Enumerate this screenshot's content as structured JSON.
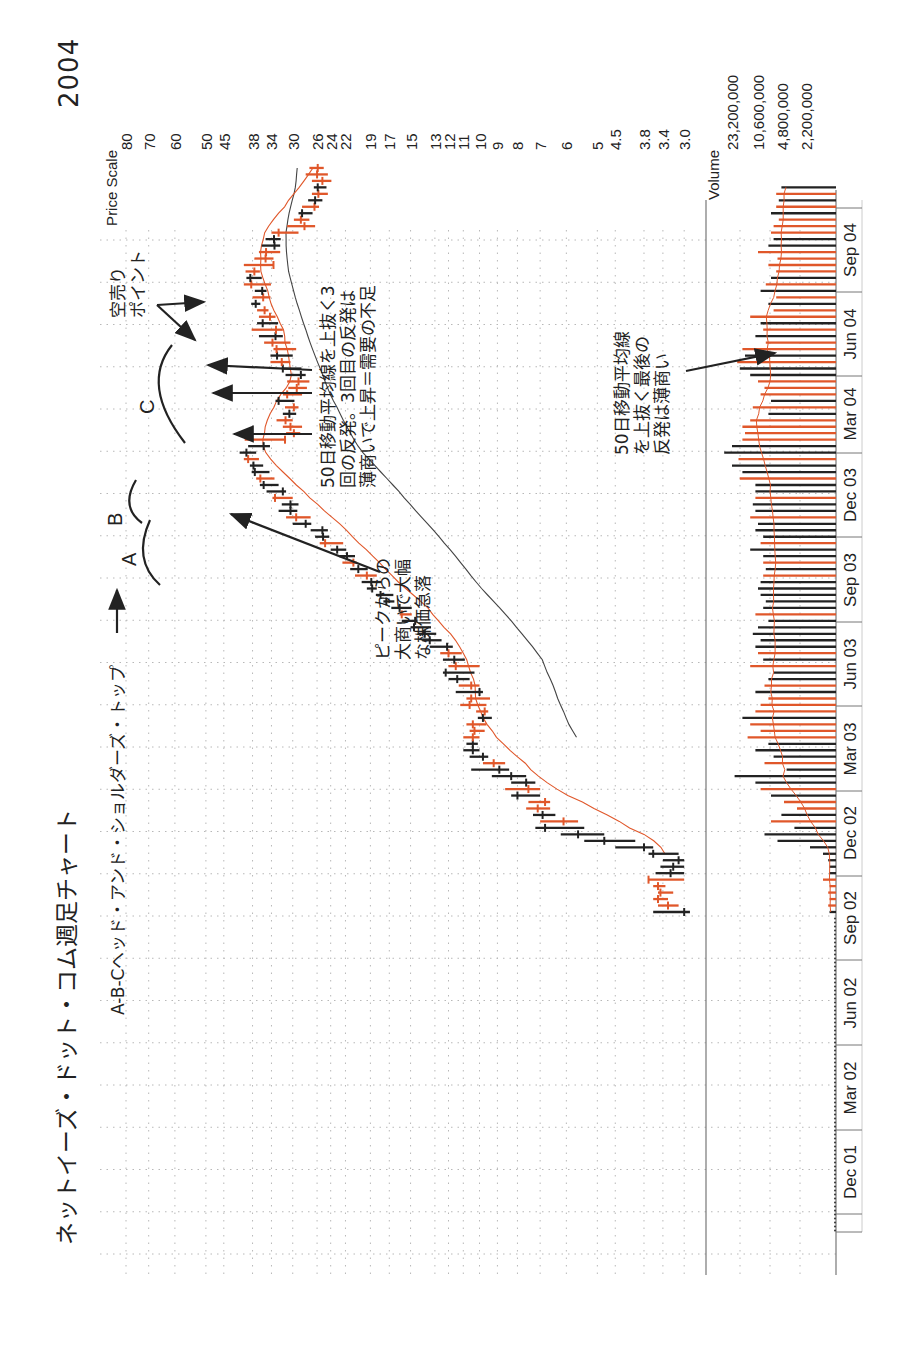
{
  "page": {
    "title": "ネットイーズ・ドット・コム週足チャート",
    "year": "2004",
    "subtitle": "A-B-Cヘッド・アンド・ショルダーズ・トップ"
  },
  "annotations": {
    "label_a": "A",
    "label_b": "B",
    "label_c": "C",
    "peak_drop": "ピークからの\n大商いで大幅\nな株価急落",
    "three_rallies": "50日移動平均線を上抜く3\n回の反発。3回目の反発は\n薄商いで上昇＝需要の不足",
    "short_point": "空売り\nポイント",
    "last_rally_volume": "50日移動平均線\nを上抜く最後の\n反発は薄商い"
  },
  "colors": {
    "up_bar": "#e0572a",
    "down_bar": "#222222",
    "ma50": "#e0572a",
    "ma200": "#444444",
    "grid": "#b8b8b8",
    "axis": "#777777"
  },
  "chart_data": {
    "type": "bar",
    "title": "ネットイーズ・ドット・コム週足チャート",
    "subtitle": "A-B-Cヘッド・アンド・ショルダーズ・トップ",
    "orientation": "rotated-90 (time runs bottom-to-top, price increases leftward)",
    "price_axis": {
      "label": "Price Scale",
      "scale": "log",
      "ticks": [
        "80",
        "70",
        "60",
        "50",
        "45",
        "38",
        "34",
        "30",
        "26",
        "24",
        "22",
        "19",
        "17",
        "15",
        "13",
        "12",
        "11",
        "10",
        "9",
        "8",
        "7",
        "6",
        "5",
        "4.5",
        "3.8",
        "3.4",
        "3.0"
      ],
      "ylim": [
        3.0,
        80
      ]
    },
    "volume_axis": {
      "label": "Volume",
      "ticks": [
        "23,200,000",
        "10,600,000",
        "4,800,000",
        "2,200,000"
      ]
    },
    "time_axis": {
      "ticks": [
        "Dec 01",
        "Mar 02",
        "Jun 02",
        "Sep 02",
        "Dec 02",
        "Mar 03",
        "Jun 03",
        "Sep 03",
        "Dec 03",
        "Mar 04",
        "Jun 04",
        "Sep 04"
      ]
    },
    "series": [
      {
        "name": "weekly price bars (high, low, close, up)",
        "weeks_start": "Sep 02",
        "bars": [
          [
            3.6,
            2.9,
            3.0,
            0
          ],
          [
            3.5,
            3.1,
            3.3,
            1
          ],
          [
            3.6,
            3.3,
            3.5,
            1
          ],
          [
            3.5,
            3.2,
            3.45,
            1
          ],
          [
            3.6,
            3.35,
            3.5,
            1
          ],
          [
            3.7,
            3.0,
            3.7,
            1
          ],
          [
            3.55,
            3.0,
            3.25,
            0
          ],
          [
            3.45,
            3.0,
            3.2,
            0
          ],
          [
            3.4,
            3.0,
            3.1,
            0
          ],
          [
            3.7,
            3.1,
            3.6,
            0
          ],
          [
            4.5,
            3.6,
            3.8,
            0
          ],
          [
            5.4,
            4.0,
            4.8,
            0
          ],
          [
            6.2,
            4.8,
            5.6,
            0
          ],
          [
            7.2,
            5.4,
            6.8,
            0
          ],
          [
            7.0,
            5.6,
            6.1,
            1
          ],
          [
            7.3,
            6.4,
            6.9,
            0
          ],
          [
            7.6,
            6.6,
            7.1,
            1
          ],
          [
            7.5,
            6.6,
            6.8,
            1
          ],
          [
            8.3,
            7.0,
            8.0,
            0
          ],
          [
            8.6,
            7.0,
            7.5,
            1
          ],
          [
            8.3,
            7.2,
            7.6,
            0
          ],
          [
            9.3,
            7.6,
            8.3,
            0
          ],
          [
            10.5,
            8.4,
            8.9,
            0
          ],
          [
            9.8,
            8.6,
            9.2,
            1
          ],
          [
            10.6,
            9.5,
            9.8,
            0
          ],
          [
            11.0,
            10.0,
            10.4,
            0
          ],
          [
            10.8,
            10.1,
            10.4,
            0
          ],
          [
            11.0,
            10.0,
            10.4,
            1
          ],
          [
            10.6,
            9.7,
            10.3,
            1
          ],
          [
            10.8,
            9.6,
            10.4,
            1
          ],
          [
            10.1,
            9.3,
            9.8,
            0
          ],
          [
            10.2,
            9.5,
            9.7,
            1
          ],
          [
            11.2,
            9.6,
            10.6,
            1
          ],
          [
            10.8,
            9.4,
            10.5,
            1
          ],
          [
            11.5,
            9.8,
            10.0,
            0
          ],
          [
            11.3,
            10.0,
            10.5,
            1
          ],
          [
            12.0,
            10.6,
            11.4,
            0
          ],
          [
            12.4,
            10.3,
            12.2,
            0
          ],
          [
            12.0,
            10.0,
            11.5,
            1
          ],
          [
            12.4,
            10.9,
            11.6,
            0
          ],
          [
            12.6,
            11.1,
            12.0,
            1
          ],
          [
            13.4,
            11.7,
            12.1,
            0
          ],
          [
            14.0,
            12.5,
            13.4,
            0
          ],
          [
            14.4,
            12.9,
            13.8,
            0
          ],
          [
            15.0,
            13.3,
            14.7,
            0
          ],
          [
            15.8,
            14.4,
            14.6,
            0
          ],
          [
            16.0,
            14.9,
            15.8,
            1
          ],
          [
            16.8,
            14.9,
            16.0,
            0
          ],
          [
            17.6,
            16.5,
            17.3,
            0
          ],
          [
            18.4,
            16.6,
            17.9,
            0
          ],
          [
            19.4,
            18.3,
            18.8,
            0
          ],
          [
            20.0,
            17.8,
            18.9,
            0
          ],
          [
            20.8,
            18.3,
            19.4,
            1
          ],
          [
            21.4,
            19.3,
            20.4,
            0
          ],
          [
            22.4,
            20.6,
            21.0,
            1
          ],
          [
            22.8,
            20.8,
            21.8,
            0
          ],
          [
            24.0,
            21.9,
            23.1,
            0
          ],
          [
            25.6,
            22.3,
            24.8,
            1
          ],
          [
            26.3,
            24.2,
            25.1,
            0
          ],
          [
            27.0,
            24.4,
            25.2,
            0
          ],
          [
            30.0,
            26.9,
            27.8,
            0
          ],
          [
            31.2,
            27.0,
            29.4,
            1
          ],
          [
            32.6,
            29.2,
            30.4,
            0
          ],
          [
            32.0,
            29.0,
            30.4,
            0
          ],
          [
            33.8,
            30.0,
            33.3,
            1
          ],
          [
            35.0,
            31.2,
            31.8,
            0
          ],
          [
            36.4,
            32.6,
            35.6,
            0
          ],
          [
            37.2,
            33.4,
            36.3,
            1
          ],
          [
            38.2,
            34.4,
            37.5,
            0
          ],
          [
            38.6,
            35.7,
            37.8,
            0
          ],
          [
            40.0,
            36.6,
            39.0,
            1
          ],
          [
            41.0,
            37.2,
            39.4,
            0
          ],
          [
            39.0,
            34.3,
            35.6,
            0
          ],
          [
            39.8,
            31.2,
            31.4,
            1
          ],
          [
            31.2,
            28.7,
            29.8,
            1
          ],
          [
            31.8,
            28.4,
            30.4,
            1
          ],
          [
            33.0,
            30.0,
            31.3,
            1
          ],
          [
            31.8,
            29.4,
            30.6,
            0
          ],
          [
            31.4,
            29.0,
            29.8,
            1
          ],
          [
            33.2,
            29.7,
            32.6,
            0
          ],
          [
            31.8,
            28.4,
            31.0,
            1
          ],
          [
            30.8,
            27.6,
            29.3,
            1
          ],
          [
            31.0,
            27.2,
            29.0,
            1
          ],
          [
            31.3,
            27.8,
            28.6,
            0
          ],
          [
            32.0,
            28.5,
            31.8,
            0
          ],
          [
            34.2,
            30.4,
            32.0,
            1
          ],
          [
            34.2,
            30.0,
            32.9,
            0
          ],
          [
            33.6,
            29.4,
            33.0,
            1
          ],
          [
            35.5,
            30.4,
            33.8,
            1
          ],
          [
            36.6,
            31.8,
            33.2,
            0
          ],
          [
            38.2,
            31.8,
            33.1,
            1
          ],
          [
            37.0,
            32.7,
            35.8,
            0
          ],
          [
            36.6,
            33.2,
            34.3,
            1
          ],
          [
            37.0,
            34.6,
            35.4,
            1
          ],
          [
            38.3,
            36.3,
            37.3,
            0
          ],
          [
            38.0,
            34.2,
            35.7,
            1
          ],
          [
            37.5,
            35.0,
            35.9,
            0
          ],
          [
            40.0,
            34.1,
            38.3,
            1
          ],
          [
            39.4,
            36.0,
            38.5,
            0
          ],
          [
            39.6,
            36.4,
            37.6,
            1
          ],
          [
            40.0,
            33.6,
            33.6,
            1
          ],
          [
            37.6,
            33.6,
            35.2,
            1
          ],
          [
            36.6,
            32.3,
            35.1,
            1
          ],
          [
            36.0,
            32.3,
            33.4,
            0
          ],
          [
            35.2,
            32.2,
            33.5,
            0
          ],
          [
            34.0,
            29.0,
            32.6,
            1
          ],
          [
            31.0,
            26.3,
            28.0,
            1
          ],
          [
            29.8,
            27.2,
            28.6,
            1
          ],
          [
            29.0,
            26.7,
            28.4,
            0
          ],
          [
            28.4,
            25.7,
            26.4,
            1
          ],
          [
            27.4,
            25.2,
            26.3,
            0
          ],
          [
            26.8,
            24.4,
            25.8,
            1
          ],
          [
            26.5,
            24.6,
            25.9,
            0
          ],
          [
            26.8,
            23.9,
            25.2,
            1
          ],
          [
            27.8,
            24.4,
            26.0,
            1
          ],
          [
            27.2,
            25.0,
            25.9,
            1
          ]
        ]
      },
      {
        "name": "50-day moving average"
      },
      {
        "name": "200-day moving average"
      },
      {
        "name": "weekly volume (fraction of panel width)",
        "values": [
          0.05,
          0.06,
          0.05,
          0.06,
          0.05,
          0.1,
          0.05,
          0.05,
          0.06,
          0.1,
          0.2,
          0.45,
          0.55,
          0.32,
          0.5,
          0.42,
          0.3,
          0.4,
          0.5,
          0.58,
          0.62,
          0.78,
          0.38,
          0.55,
          0.48,
          0.62,
          0.52,
          0.68,
          0.58,
          0.66,
          0.72,
          0.62,
          0.58,
          0.52,
          0.62,
          0.55,
          0.52,
          0.48,
          0.66,
          0.56,
          0.6,
          0.62,
          0.58,
          0.64,
          0.6,
          0.52,
          0.62,
          0.56,
          0.54,
          0.58,
          0.6,
          0.58,
          0.56,
          0.54,
          0.56,
          0.56,
          0.66,
          0.58,
          0.56,
          0.62,
          0.6,
          0.66,
          0.62,
          0.64,
          0.62,
          0.62,
          0.62,
          0.74,
          0.72,
          0.8,
          0.75,
          0.86,
          0.8,
          0.72,
          0.7,
          0.72,
          0.66,
          0.52,
          0.64,
          0.5,
          0.58,
          0.55,
          0.6,
          0.66,
          0.74,
          0.76,
          0.7,
          0.72,
          0.54,
          0.62,
          0.56,
          0.58,
          0.66,
          0.48,
          0.52,
          0.46,
          0.58,
          0.54,
          0.5,
          0.46,
          0.52,
          0.45,
          0.6,
          0.52,
          0.48,
          0.5,
          0.48,
          0.44,
          0.5,
          0.46,
          0.44,
          0.46,
          0.42
        ]
      }
    ]
  }
}
